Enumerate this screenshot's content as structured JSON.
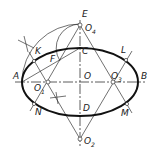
{
  "diagram": {
    "colors": {
      "ellipse": "#111111",
      "construction": "#333333",
      "background": "#ffffff"
    },
    "labels": {
      "E": "E",
      "O4": "O",
      "O4_sub": "4",
      "K": "K",
      "C": "C",
      "L": "L",
      "F": "F",
      "A": "A",
      "O": "O",
      "O3": "O",
      "O3_sub": "3",
      "B": "B",
      "O1": "O",
      "O1_sub": "1",
      "N": "N",
      "D": "D",
      "M": "M",
      "O2": "O",
      "O2_sub": "2"
    },
    "points": {
      "A": [
        22,
        82
      ],
      "B": [
        138,
        82
      ],
      "C": [
        80,
        48
      ],
      "D": [
        80,
        116
      ],
      "O": [
        80,
        82
      ],
      "E": [
        80,
        24
      ],
      "O4": [
        80,
        25
      ],
      "O2": [
        80,
        139
      ],
      "O1": [
        48,
        82
      ],
      "O3": [
        113,
        82
      ],
      "K": [
        34,
        61
      ],
      "L": [
        126,
        60
      ],
      "N": [
        34,
        104
      ],
      "M": [
        127,
        104
      ],
      "F": [
        57,
        58
      ]
    }
  }
}
